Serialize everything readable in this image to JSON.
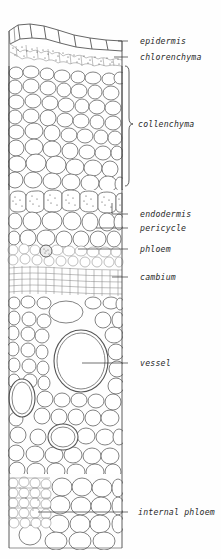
{
  "figure": {
    "style": "line drawing, black ink on white",
    "background_color": "#fefefe",
    "ink_color": "#333333",
    "drawing_bounds": {
      "x": 8,
      "y": 20,
      "width": 114,
      "height": 530
    }
  },
  "labels": [
    {
      "id": "epidermis",
      "text": "epidermis",
      "x": 140,
      "y": 44,
      "leader_type": "line",
      "leader_from_x": 128,
      "leader_to_x": 122,
      "leader_y": 41,
      "target_y": 41
    },
    {
      "id": "chlorenchyma",
      "text": "chlorenchyma",
      "x": 140,
      "y": 60,
      "leader_type": "line",
      "leader_from_x": 128,
      "leader_to_x": 120,
      "leader_y": 57,
      "target_y": 57
    },
    {
      "id": "collenchyma",
      "text": "collenchyma",
      "x": 142,
      "y": 127,
      "leader_type": "brace",
      "leader_from_x": 128,
      "leader_to_x": 124,
      "leader_y": 124,
      "brace_top": 66,
      "brace_bottom": 186
    },
    {
      "id": "endodermis",
      "text": "endodermis",
      "x": 140,
      "y": 217,
      "leader_type": "line",
      "leader_from_x": 130,
      "leader_to_x": 112,
      "leader_y": 214,
      "target_y": 203
    },
    {
      "id": "pericycle",
      "text": "pericycle",
      "x": 140,
      "y": 231,
      "leader_type": "line",
      "leader_from_x": 130,
      "leader_to_x": 96,
      "leader_y": 228,
      "target_y": 228
    },
    {
      "id": "phloem",
      "text": "phloem",
      "x": 140,
      "y": 252,
      "leader_type": "line",
      "leader_from_x": 130,
      "leader_to_x": 78,
      "leader_y": 249,
      "target_y": 249
    },
    {
      "id": "cambium",
      "text": "cambium",
      "x": 140,
      "y": 280,
      "leader_type": "line",
      "leader_from_x": 130,
      "leader_to_x": 112,
      "leader_y": 277,
      "target_y": 277
    },
    {
      "id": "vessel",
      "text": "vessel",
      "x": 140,
      "y": 366,
      "leader_type": "line",
      "leader_from_x": 130,
      "leader_to_x": 82,
      "leader_y": 363,
      "target_y": 363
    },
    {
      "id": "internal-phloem",
      "text": "internal phloem",
      "x": 140,
      "y": 515,
      "leader_type": "line",
      "leader_from_x": 130,
      "leader_to_x": 38,
      "leader_y": 512,
      "target_y": 512
    }
  ],
  "tissue_zones": [
    {
      "id": "epidermis-zone",
      "name": "epidermis",
      "y_top": 24,
      "y_bottom": 46,
      "description": "single row of rectangular cells along outer margin"
    },
    {
      "id": "chlorenchyma-zone",
      "name": "chlorenchyma",
      "y_top": 46,
      "y_bottom": 66,
      "description": "band of small stippled cells beneath epidermis"
    },
    {
      "id": "collenchyma-zone",
      "name": "collenchyma",
      "y_top": 66,
      "y_bottom": 188,
      "description": "large rounded polygonal cells with thickened walls"
    },
    {
      "id": "endodermis-zone",
      "name": "endodermis",
      "y_top": 190,
      "y_bottom": 212,
      "description": "row of stippled barrel-shaped cells"
    },
    {
      "id": "pericycle-zone",
      "name": "pericycle",
      "y_top": 212,
      "y_bottom": 240,
      "description": "irregular cells inside endodermis"
    },
    {
      "id": "phloem-zone",
      "name": "phloem",
      "y_top": 240,
      "y_bottom": 262,
      "description": "small sieve tubes and companion cells"
    },
    {
      "id": "cambium-zone",
      "name": "cambium",
      "y_top": 262,
      "y_bottom": 296,
      "description": "flattened elongated cells in tangential rows"
    },
    {
      "id": "xylem-zone",
      "name": "xylem",
      "y_top": 296,
      "y_bottom": 470,
      "description": "parenchyma with large vessel elements"
    },
    {
      "id": "internal-phloem-zone",
      "name": "internal phloem",
      "y_top": 470,
      "y_bottom": 548,
      "description": "dense small-celled patch at inner boundary"
    }
  ],
  "features": {
    "main_vessel": {
      "name": "vessel",
      "cx": 81,
      "cy": 361,
      "rx": 27,
      "ry": 31,
      "double_walled": true
    },
    "secondary_vessels": [
      {
        "cx": 22,
        "cy": 398,
        "rx": 13,
        "ry": 19
      },
      {
        "cx": 63,
        "cy": 437,
        "rx": 15,
        "ry": 13
      },
      {
        "cx": 66,
        "cy": 312,
        "rx": 17,
        "ry": 11
      },
      {
        "cx": 47,
        "cy": 253,
        "rx": 6,
        "ry": 6
      }
    ]
  }
}
